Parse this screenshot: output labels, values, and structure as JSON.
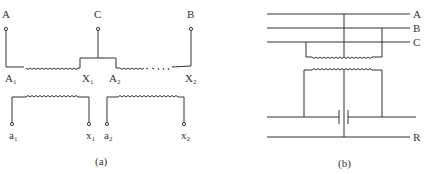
{
  "diagram_a": {
    "caption": "(a)",
    "terminals_top": {
      "A": "A",
      "C": "C",
      "B": "B"
    },
    "winding_labels": {
      "A1": "A",
      "A1_sub": "1",
      "X1": "X",
      "X1_sub": "1",
      "A2": "A",
      "A2_sub": "2",
      "X2": "X",
      "X2_sub": "2"
    },
    "secondary_labels": {
      "a1": "a",
      "a1_sub": "1",
      "x1": "x",
      "x1_sub": "1",
      "a2": "a",
      "a2_sub": "2",
      "x2": "x",
      "x2_sub": "2"
    }
  },
  "diagram_b": {
    "caption": "(b)",
    "bus_labels": {
      "A": "A",
      "B": "B",
      "C": "C",
      "R": "R"
    }
  },
  "colors": {
    "line": "#333333",
    "background": "#ffffff"
  }
}
